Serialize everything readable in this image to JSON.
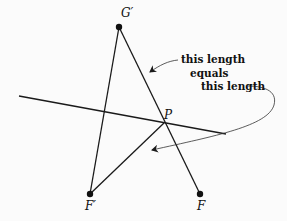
{
  "diagram": {
    "points": {
      "G_prime": {
        "label": "G′",
        "x": 119,
        "y": 27
      },
      "F_prime": {
        "label": "F′",
        "x": 90,
        "y": 194
      },
      "F": {
        "label": "F",
        "x": 200,
        "y": 194
      },
      "P": {
        "label": "P",
        "x": 164,
        "y": 123
      }
    },
    "annotation": {
      "line1": "this length",
      "line2": "equals",
      "line3": "this length"
    },
    "colors": {
      "stroke": "#1a1a1a",
      "background": "#fbfbfb"
    }
  }
}
